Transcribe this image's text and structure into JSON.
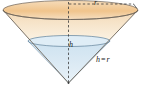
{
  "figure": {
    "kind": "geometry-diagram",
    "shape": "inverted-cone-with-liquid",
    "width": 141,
    "height": 88,
    "background": "#ffffff"
  },
  "labels": {
    "radius": "r",
    "height": "h",
    "relation": {
      "left": "h",
      "operator": "=",
      "right": "r",
      "full": "h = r"
    }
  },
  "colors": {
    "cone_fill_top": "#f7dfc0",
    "cone_fill_bottom": "#faf0de",
    "cone_rim_band": "#f2c893",
    "cone_outline": "#6b6257",
    "liquid_fill": "#d9e9f3",
    "liquid_surface": "#cfe3f0",
    "liquid_outline": "#5b7f9b",
    "dashed_line": "#3a3a3a",
    "label_text": "#1a1a1a"
  },
  "geometry": {
    "top_ellipse": {
      "cx": 70.5,
      "cy": 10,
      "rx": 67.5,
      "ry": 9.5
    },
    "liquid_ellipse": {
      "cx": 69,
      "cy": 41,
      "rx": 41,
      "ry": 5.5
    },
    "apex": {
      "x": 68.5,
      "y": 83
    },
    "axis": {
      "x": 68.5,
      "y_top": 2,
      "y_bottom": 83
    },
    "radius_line": {
      "y": 4,
      "x_start": 69,
      "x_end": 133
    }
  }
}
